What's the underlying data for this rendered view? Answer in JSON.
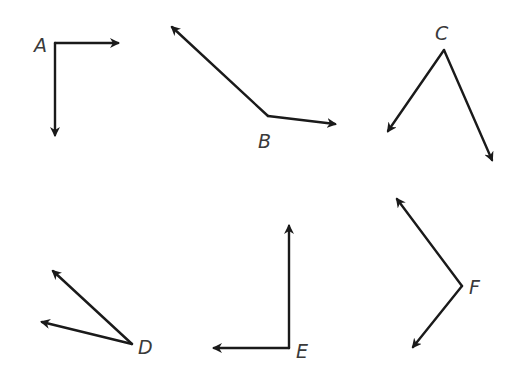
{
  "diagram": {
    "type": "angles",
    "colors": {
      "stroke": "#1a1a1a",
      "label": "#3a3a3a",
      "background": "#ffffff"
    },
    "angles": [
      {
        "label": "A",
        "vertex": [
          55,
          43
        ],
        "rays": [
          [
            118,
            43
          ],
          [
            55,
            135
          ]
        ],
        "label_pos": [
          34,
          52
        ]
      },
      {
        "label": "B",
        "vertex": [
          268,
          116
        ],
        "rays": [
          [
            172,
            27
          ],
          [
            335,
            124
          ]
        ],
        "label_pos": [
          258,
          148
        ]
      },
      {
        "label": "C",
        "vertex": [
          444,
          50
        ],
        "rays": [
          [
            388,
            131
          ],
          [
            492,
            160
          ]
        ],
        "label_pos": [
          435,
          40
        ]
      },
      {
        "label": "D",
        "vertex": [
          132,
          344
        ],
        "rays": [
          [
            53,
            271
          ],
          [
            42,
            322
          ]
        ],
        "label_pos": [
          138,
          354
        ]
      },
      {
        "label": "E",
        "vertex": [
          289,
          348
        ],
        "rays": [
          [
            289,
            226
          ],
          [
            214,
            348
          ]
        ],
        "label_pos": [
          296,
          358
        ]
      },
      {
        "label": "F",
        "vertex": [
          462,
          286
        ],
        "rays": [
          [
            397,
            199
          ],
          [
            413,
            347
          ]
        ],
        "label_pos": [
          469,
          294
        ]
      }
    ]
  }
}
